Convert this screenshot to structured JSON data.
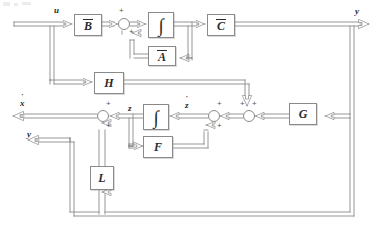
{
  "diagram": {
    "type": "control-block-diagram",
    "canvas": {
      "width": 381,
      "height": 244
    },
    "line_color": "#8a8a8a",
    "text_color": "#2b2b2b",
    "background": "#ffffff"
  },
  "io": {
    "input_u": "u",
    "output_y": "y",
    "estimate_xhat": "x̂",
    "output_y_lower": "y"
  },
  "blocks": [
    {
      "id": "B",
      "label": "B",
      "overbar": true,
      "x": 74,
      "y": 14,
      "w": 28,
      "h": 22
    },
    {
      "id": "I1",
      "label": "∫",
      "overbar": false,
      "x": 148,
      "y": 12,
      "w": 26,
      "h": 26
    },
    {
      "id": "A",
      "label": "A",
      "overbar": true,
      "x": 148,
      "y": 46,
      "w": 28,
      "h": 20
    },
    {
      "id": "C",
      "label": "C",
      "overbar": true,
      "x": 207,
      "y": 14,
      "w": 28,
      "h": 22
    },
    {
      "id": "H",
      "label": "H",
      "overbar": false,
      "x": 94,
      "y": 72,
      "w": 30,
      "h": 22
    },
    {
      "id": "I2",
      "label": "∫",
      "overbar": false,
      "x": 143,
      "y": 104,
      "w": 26,
      "h": 26
    },
    {
      "id": "F",
      "label": "F",
      "overbar": false,
      "x": 143,
      "y": 136,
      "w": 30,
      "h": 22
    },
    {
      "id": "L",
      "label": "L",
      "overbar": false,
      "x": 90,
      "y": 166,
      "w": 24,
      "h": 24
    },
    {
      "id": "G",
      "label": "G",
      "overbar": false,
      "x": 289,
      "y": 103,
      "w": 28,
      "h": 22
    }
  ],
  "summing_junctions": [
    {
      "id": "S1",
      "cx": 124,
      "cy": 24,
      "r": 6,
      "signs": [
        {
          "text": "+",
          "dx": -5,
          "dy": -12
        },
        {
          "text": "+",
          "dx": 5,
          "dy": 4
        }
      ]
    },
    {
      "id": "S2",
      "cx": 249,
      "cy": 116,
      "r": 6,
      "signs": [
        {
          "text": "+",
          "dx": -9,
          "dy": -11
        },
        {
          "text": "+",
          "dx": 3,
          "dy": -11
        }
      ]
    },
    {
      "id": "S3",
      "cx": 214,
      "cy": 116,
      "r": 6,
      "signs": [
        {
          "text": "+",
          "dx": 3,
          "dy": -11
        },
        {
          "text": "+",
          "dx": 3,
          "dy": 3
        }
      ]
    },
    {
      "id": "S4",
      "cx": 103,
      "cy": 116,
      "r": 6,
      "signs": [
        {
          "text": "+",
          "dx": 3,
          "dy": -11
        },
        {
          "text": "+",
          "dx": 3,
          "dy": 3
        }
      ]
    }
  ],
  "signal_labels": [
    {
      "id": "u",
      "text": "u",
      "accent": "",
      "x": 54,
      "y": 6
    },
    {
      "id": "y",
      "text": "y",
      "accent": "",
      "x": 355,
      "y": 7
    },
    {
      "id": "xhat",
      "text": "x",
      "accent": "˙",
      "x": 20,
      "y": 99
    },
    {
      "id": "ylow",
      "text": "y",
      "accent": "",
      "x": 27,
      "y": 130
    },
    {
      "id": "z",
      "text": "z",
      "accent": "˙",
      "x": 128,
      "y": 104
    },
    {
      "id": "zdot",
      "text": "z",
      "accent": "˙",
      "x": 185,
      "y": 101
    }
  ]
}
